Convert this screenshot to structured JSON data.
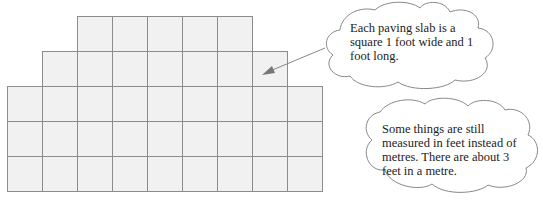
{
  "paving": {
    "slab_size_px": 35,
    "origin_x": 7,
    "origin_y": 16,
    "fill": "#f1f1f1",
    "stroke": "#8c8c8c",
    "rows": [
      {
        "start_col": 2,
        "count": 5
      },
      {
        "start_col": 1,
        "count": 7
      },
      {
        "start_col": 0,
        "count": 9
      },
      {
        "start_col": 0,
        "count": 9
      },
      {
        "start_col": 0,
        "count": 9
      }
    ]
  },
  "callouts": [
    {
      "text": "Each paving slab is a square 1 foot wide and 1 foot long."
    },
    {
      "text": "Some things are still measured in feet instead of metres. There are about 3 feet in a metre."
    }
  ]
}
